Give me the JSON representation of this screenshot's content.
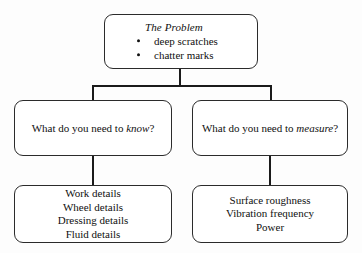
{
  "diagram": {
    "title": "The Problem",
    "nodes": {
      "problem": {
        "heading": "The Problem",
        "bullets": [
          "deep scratches",
          "chatter marks"
        ]
      },
      "know": {
        "text_before": "What do you need to ",
        "emphasis": "know",
        "text_after": "?",
        "full_text": "What do you need to know?"
      },
      "measure": {
        "text_before": "What do you need to ",
        "emphasis": "measure",
        "text_after": "?",
        "full_text": "What do you need to measure?"
      },
      "know_details": {
        "lines": [
          "Work details",
          "Wheel details",
          "Dressing details",
          "Fluid details"
        ]
      },
      "measure_details": {
        "lines": [
          "Surface roughness",
          "Vibration frequency",
          "Power"
        ]
      }
    },
    "colors": {
      "background": "#fdfdfd",
      "box_fill": "#ffffff",
      "box_border": "#2b2b2b",
      "connector": "#1b1b1b",
      "text": "#101010"
    }
  }
}
